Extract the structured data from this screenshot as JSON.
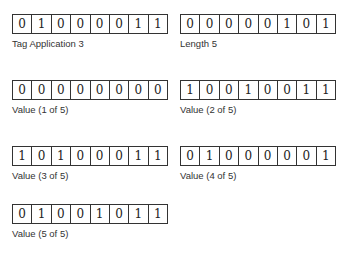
{
  "fields": [
    {
      "id": "tag",
      "caption": "Tag Application 3",
      "bits": [
        "0",
        "1",
        "0",
        "0",
        "0",
        "0",
        "1",
        "1"
      ]
    },
    {
      "id": "length",
      "caption": "Length 5",
      "bits": [
        "0",
        "0",
        "0",
        "0",
        "0",
        "1",
        "0",
        "1"
      ]
    },
    {
      "id": "value1",
      "caption": "Value (1 of 5)",
      "bits": [
        "0",
        "0",
        "0",
        "0",
        "0",
        "0",
        "0",
        "0"
      ]
    },
    {
      "id": "value2",
      "caption": "Value (2 of 5)",
      "bits": [
        "1",
        "0",
        "0",
        "1",
        "0",
        "0",
        "1",
        "1"
      ]
    },
    {
      "id": "value3",
      "caption": "Value (3 of 5)",
      "bits": [
        "1",
        "0",
        "1",
        "0",
        "0",
        "0",
        "1",
        "1"
      ]
    },
    {
      "id": "value4",
      "caption": "Value (4 of 5)",
      "bits": [
        "0",
        "1",
        "0",
        "0",
        "0",
        "0",
        "0",
        "1"
      ]
    },
    {
      "id": "value5",
      "caption": "Value (5 of 5)",
      "bits": [
        "0",
        "1",
        "0",
        "0",
        "1",
        "0",
        "1",
        "1"
      ]
    }
  ]
}
